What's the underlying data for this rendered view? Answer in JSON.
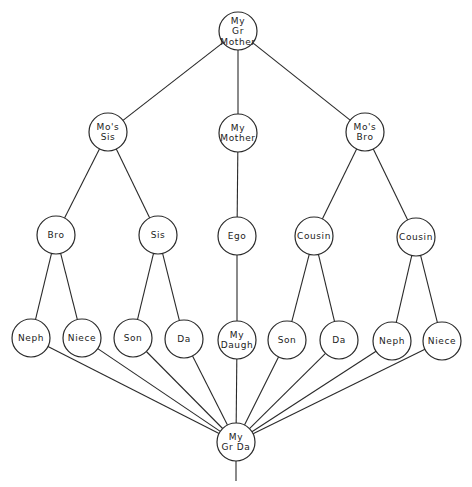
{
  "diagram": {
    "type": "kinship-tree",
    "colors": {
      "line": "#2a2a2a",
      "background": "#ffffff"
    },
    "node_radius": 19,
    "nodes": [
      {
        "id": "grandmother",
        "lines": [
          "My",
          "Gr",
          "Mother"
        ],
        "x": 238,
        "y": 31
      },
      {
        "id": "mos-sis",
        "lines": [
          "Mo's",
          "Sis"
        ],
        "x": 108,
        "y": 132
      },
      {
        "id": "my-mother",
        "lines": [
          "My",
          "Mother"
        ],
        "x": 238,
        "y": 133
      },
      {
        "id": "mos-bro",
        "lines": [
          "Mo's",
          "Bro"
        ],
        "x": 365,
        "y": 132
      },
      {
        "id": "bro",
        "lines": [
          "Bro"
        ],
        "x": 56,
        "y": 235
      },
      {
        "id": "sis",
        "lines": [
          "Sis"
        ],
        "x": 158,
        "y": 235
      },
      {
        "id": "ego",
        "lines": [
          "Ego"
        ],
        "x": 237,
        "y": 236
      },
      {
        "id": "cousin-1",
        "lines": [
          "Cousin"
        ],
        "x": 314,
        "y": 236
      },
      {
        "id": "cousin-2",
        "lines": [
          "Cousin"
        ],
        "x": 416,
        "y": 237
      },
      {
        "id": "neph-1",
        "lines": [
          "Neph"
        ],
        "x": 31,
        "y": 338
      },
      {
        "id": "niece-1",
        "lines": [
          "Niece"
        ],
        "x": 82,
        "y": 338
      },
      {
        "id": "son-1",
        "lines": [
          "Son"
        ],
        "x": 133,
        "y": 338
      },
      {
        "id": "da-1",
        "lines": [
          "Da"
        ],
        "x": 184,
        "y": 339
      },
      {
        "id": "my-daugh",
        "lines": [
          "My",
          "Daugh"
        ],
        "x": 237,
        "y": 340
      },
      {
        "id": "son-2",
        "lines": [
          "Son"
        ],
        "x": 287,
        "y": 340
      },
      {
        "id": "da-2",
        "lines": [
          "Da"
        ],
        "x": 339,
        "y": 340
      },
      {
        "id": "neph-2",
        "lines": [
          "Neph"
        ],
        "x": 392,
        "y": 341
      },
      {
        "id": "niece-2",
        "lines": [
          "Niece"
        ],
        "x": 442,
        "y": 341
      },
      {
        "id": "my-gr-da",
        "lines": [
          "My",
          "Gr Da"
        ],
        "x": 236,
        "y": 442
      }
    ],
    "edges": [
      [
        "grandmother",
        "mos-sis"
      ],
      [
        "grandmother",
        "my-mother"
      ],
      [
        "grandmother",
        "mos-bro"
      ],
      [
        "mos-sis",
        "bro"
      ],
      [
        "mos-sis",
        "sis"
      ],
      [
        "my-mother",
        "ego"
      ],
      [
        "mos-bro",
        "cousin-1"
      ],
      [
        "mos-bro",
        "cousin-2"
      ],
      [
        "bro",
        "neph-1"
      ],
      [
        "bro",
        "niece-1"
      ],
      [
        "sis",
        "son-1"
      ],
      [
        "sis",
        "da-1"
      ],
      [
        "ego",
        "my-daugh"
      ],
      [
        "cousin-1",
        "son-2"
      ],
      [
        "cousin-1",
        "da-2"
      ],
      [
        "cousin-2",
        "neph-2"
      ],
      [
        "cousin-2",
        "niece-2"
      ],
      [
        "neph-1",
        "my-gr-da"
      ],
      [
        "niece-1",
        "my-gr-da"
      ],
      [
        "son-1",
        "my-gr-da"
      ],
      [
        "da-1",
        "my-gr-da"
      ],
      [
        "my-daugh",
        "my-gr-da"
      ],
      [
        "son-2",
        "my-gr-da"
      ],
      [
        "da-2",
        "my-gr-da"
      ],
      [
        "neph-2",
        "my-gr-da"
      ],
      [
        "niece-2",
        "my-gr-da"
      ]
    ],
    "tail": {
      "from": "my-gr-da",
      "x": 236,
      "y1": 461,
      "y2": 481
    }
  }
}
